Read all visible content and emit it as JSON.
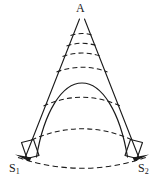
{
  "figure": {
    "kind": "geometric-sector-diagram",
    "background_color": "#ffffff",
    "stroke_color": "#1a1a1a",
    "width": 165,
    "height": 183,
    "labels": {
      "apex": "A",
      "source_left_base": "S",
      "source_left_sub": "1",
      "source_right_base": "S",
      "source_right_sub": "2"
    },
    "geometry": {
      "apex_point": [
        82,
        17
      ],
      "sector_half_angle_deg": 21,
      "left_edge_start": [
        82,
        17
      ],
      "left_edge_end": [
        27,
        157
      ],
      "right_edge_start": [
        82,
        17
      ],
      "right_edge_end": [
        137,
        157
      ],
      "dashed_arc_radii": [
        22,
        32,
        43,
        57,
        90,
        150
      ],
      "outer_arc_radius": 150,
      "parabola_apex": [
        82,
        83
      ],
      "parabola_left_foot": [
        37,
        155
      ],
      "parabola_right_foot": [
        127,
        155
      ],
      "slit_left_quad": [
        [
          22,
          142
        ],
        [
          34,
          139
        ],
        [
          39,
          155
        ],
        [
          27,
          158
        ]
      ],
      "slit_right_quad": [
        [
          126,
          139
        ],
        [
          138,
          142
        ],
        [
          133,
          158
        ],
        [
          121,
          155
        ]
      ],
      "arrowhead_left_tip": [
        16,
        157
      ],
      "arrowhead_right_tip": [
        146,
        157
      ]
    }
  }
}
